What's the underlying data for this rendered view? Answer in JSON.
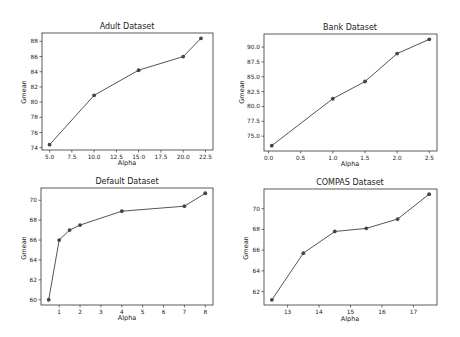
{
  "figure": {
    "background": "#ffffff",
    "line_color": "#555555",
    "marker_color": "#444444"
  },
  "chart_data": [
    {
      "type": "line",
      "title": "Adult Dataset",
      "xlabel": "Alpha",
      "ylabel": "Gmean",
      "x": [
        5.0,
        10.0,
        15.0,
        20.0,
        22.0
      ],
      "values": [
        74.4,
        80.9,
        84.2,
        86.0,
        88.4
      ],
      "xticks": [
        5.0,
        7.5,
        10.0,
        12.5,
        15.0,
        17.5,
        20.0,
        22.5
      ],
      "xtick_labels": [
        "5.0",
        "7.5",
        "10.0",
        "12.5",
        "15.0",
        "17.5",
        "20.0",
        "22.5"
      ],
      "yticks": [
        74,
        76,
        78,
        80,
        82,
        84,
        86,
        88
      ],
      "ytick_labels": [
        "74",
        "76",
        "78",
        "80",
        "82",
        "84",
        "86",
        "88"
      ],
      "xlim": [
        4.15,
        23.35
      ],
      "ylim": [
        73.7,
        89.1
      ],
      "grid": false,
      "frame": {
        "x": 42,
        "y": 33,
        "w": 171,
        "h": 117
      }
    },
    {
      "type": "line",
      "title": "Bank Dataset",
      "xlabel": "Alpha",
      "ylabel": "Gmean",
      "x": [
        0.05,
        1.0,
        1.5,
        2.0,
        2.5
      ],
      "values": [
        73.4,
        81.3,
        84.2,
        88.9,
        91.3
      ],
      "xticks": [
        0.0,
        0.5,
        1.0,
        1.5,
        2.0,
        2.5
      ],
      "xtick_labels": [
        "0.0",
        "0.5",
        "1.0",
        "1.5",
        "2.0",
        "2.5"
      ],
      "yticks": [
        75.0,
        77.5,
        80.0,
        82.5,
        85.0,
        87.5,
        90.0
      ],
      "ytick_labels": [
        "75.0",
        "77.5",
        "80.0",
        "82.5",
        "85.0",
        "87.5",
        "90.0"
      ],
      "xlim": [
        -0.07,
        2.62
      ],
      "ylim": [
        72.5,
        92.2
      ],
      "grid": false,
      "frame": {
        "x": 264,
        "y": 34,
        "w": 173,
        "h": 117
      }
    },
    {
      "type": "line",
      "title": "Default Dataset",
      "xlabel": "Alpha",
      "ylabel": "Gmean",
      "x": [
        0.5,
        1.0,
        1.5,
        2.0,
        4.0,
        7.0,
        8.0
      ],
      "values": [
        60.0,
        66.0,
        67.0,
        67.5,
        68.9,
        69.4,
        70.7
      ],
      "xticks": [
        1,
        2,
        3,
        4,
        5,
        6,
        7,
        8
      ],
      "xtick_labels": [
        "1",
        "2",
        "3",
        "4",
        "5",
        "6",
        "7",
        "8"
      ],
      "yticks": [
        60,
        62,
        64,
        66,
        68,
        70
      ],
      "ytick_labels": [
        "60",
        "62",
        "64",
        "66",
        "68",
        "70"
      ],
      "xlim": [
        0.13,
        8.37
      ],
      "ylim": [
        59.47,
        71.23
      ],
      "grid": false,
      "frame": {
        "x": 41,
        "y": 188,
        "w": 172,
        "h": 117
      }
    },
    {
      "type": "line",
      "title": "COMPAS Dataset",
      "xlabel": "Alpha",
      "ylabel": "Gmean",
      "x": [
        12.5,
        13.5,
        14.5,
        15.5,
        16.5,
        17.5
      ],
      "values": [
        61.2,
        65.7,
        67.8,
        68.1,
        69.0,
        71.4
      ],
      "xticks": [
        13,
        14,
        15,
        16,
        17
      ],
      "xtick_labels": [
        "13",
        "14",
        "15",
        "16",
        "17"
      ],
      "yticks": [
        62,
        64,
        66,
        68,
        70
      ],
      "ytick_labels": [
        "62",
        "64",
        "66",
        "68",
        "70"
      ],
      "xlim": [
        12.25,
        17.75
      ],
      "ylim": [
        60.7,
        71.9
      ],
      "grid": false,
      "frame": {
        "x": 264,
        "y": 189,
        "w": 173,
        "h": 116
      }
    }
  ]
}
